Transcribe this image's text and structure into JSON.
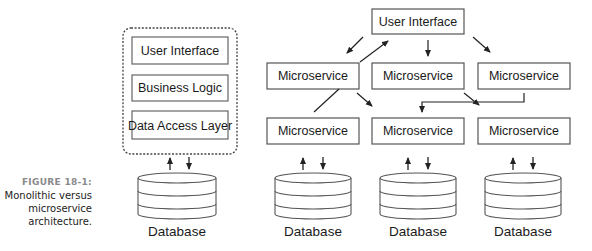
{
  "caption": {
    "figure_label": "FIGURE 18-1:",
    "lines": [
      "Monolithic versus",
      "microservice",
      "architecture."
    ]
  },
  "monolith": {
    "layers": [
      "User Interface",
      "Business Logic",
      "Data Access Layer"
    ],
    "database_label": "Database"
  },
  "microservices": {
    "top": "User Interface",
    "middle_row": [
      "Microservice",
      "Microservice",
      "Microservice"
    ],
    "bottom_row": [
      "Microservice",
      "Microservice",
      "Microservice"
    ],
    "database_labels": [
      "Database",
      "Database",
      "Database"
    ]
  },
  "colors": {
    "stroke": "#3a3a3a",
    "box_border": "#555555",
    "caption_label": "#8a8a8a"
  }
}
